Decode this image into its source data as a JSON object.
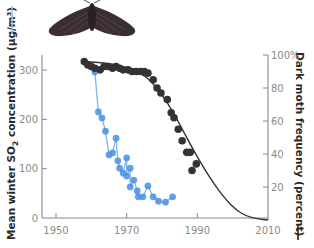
{
  "chart_data": {
    "type": "scatter",
    "title": "",
    "xlabel": "",
    "ylabel_left": "Mean winter SO₂ concentration (µg/m³)",
    "ylabel_left_parts": {
      "pre": "Mean winter SO",
      "sub": "2",
      "post": " concentration (µg/m³)"
    },
    "ylabel_right": "Dark moth frequency (percent)",
    "xlim": [
      1946,
      2010
    ],
    "ylim_left": [
      0,
      330
    ],
    "ylim_right": [
      0,
      100
    ],
    "x_ticks": [
      1950,
      1970,
      1990,
      2010
    ],
    "y_left_ticks": [
      0,
      100,
      200,
      300
    ],
    "y_right_ticks": [
      {
        "value": 20,
        "label": "20"
      },
      {
        "value": 40,
        "label": "40"
      },
      {
        "value": 60,
        "label": "60"
      },
      {
        "value": 80,
        "label": "80"
      },
      {
        "value": 100,
        "label": "100%"
      }
    ],
    "grid": false,
    "legend": "none (axis-label line markers)",
    "series": [
      {
        "name": "Mean winter SO2 concentration",
        "axis": "left",
        "color": "#4a90e2",
        "style": "line+markers",
        "points": [
          [
            1961,
            296
          ],
          [
            1962,
            215
          ],
          [
            1963,
            203
          ],
          [
            1964,
            176
          ],
          [
            1965,
            128
          ],
          [
            1966,
            132
          ],
          [
            1967,
            162
          ],
          [
            1967.5,
            116
          ],
          [
            1968,
            101
          ],
          [
            1969,
            91
          ],
          [
            1970,
            122
          ],
          [
            1970,
            85
          ],
          [
            1971,
            101
          ],
          [
            1971,
            63
          ],
          [
            1972,
            77
          ],
          [
            1973,
            55
          ],
          [
            1973.3,
            43
          ],
          [
            1974.6,
            43
          ],
          [
            1976,
            65
          ],
          [
            1977.5,
            43
          ],
          [
            1979,
            34
          ],
          [
            1981,
            32
          ],
          [
            1983,
            43
          ]
        ]
      },
      {
        "name": "Dark moth frequency",
        "axis": "right",
        "color": "#333333",
        "style": "markers",
        "points": [
          [
            1958,
            96
          ],
          [
            1959,
            94
          ],
          [
            1960,
            93
          ],
          [
            1961,
            92
          ],
          [
            1962.5,
            91
          ],
          [
            1963.6,
            93
          ],
          [
            1964.7,
            93
          ],
          [
            1966,
            92
          ],
          [
            1967,
            93
          ],
          [
            1968,
            92
          ],
          [
            1969,
            91
          ],
          [
            1970.4,
            91
          ],
          [
            1971.5,
            90
          ],
          [
            1972.7,
            90
          ],
          [
            1974,
            90
          ],
          [
            1975,
            90
          ],
          [
            1976,
            89
          ],
          [
            1977.5,
            85
          ],
          [
            1978.6,
            80
          ],
          [
            1979.7,
            77
          ],
          [
            1981.5,
            73
          ],
          [
            1982.6,
            65
          ],
          [
            1983.4,
            62
          ],
          [
            1984.6,
            55
          ],
          [
            1985.7,
            48
          ],
          [
            1987,
            41
          ],
          [
            1988,
            41
          ],
          [
            1989.7,
            34
          ],
          [
            1988.5,
            30
          ]
        ]
      },
      {
        "name": "Dark moth frequency fitted curve",
        "axis": "right",
        "color": "#333333",
        "style": "line",
        "points": [
          [
            1958,
            96
          ],
          [
            1962,
            95.5
          ],
          [
            1966,
            94.5
          ],
          [
            1970,
            92.5
          ],
          [
            1974,
            89
          ],
          [
            1977,
            84
          ],
          [
            1980,
            76
          ],
          [
            1983,
            66
          ],
          [
            1986,
            54
          ],
          [
            1989,
            42
          ],
          [
            1992,
            31
          ],
          [
            1995,
            21
          ],
          [
            1998,
            12.5
          ],
          [
            2001,
            6
          ],
          [
            2004,
            2.2
          ],
          [
            2007,
            0.6
          ],
          [
            2010,
            0
          ]
        ]
      }
    ],
    "illustration": "peppered-moth-dark-form"
  }
}
